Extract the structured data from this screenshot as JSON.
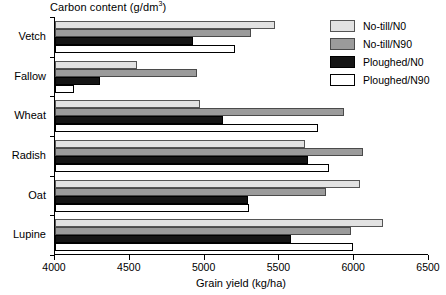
{
  "chart_data": {
    "type": "bar",
    "orientation": "horizontal",
    "title": "Carbon content (g/dm3)",
    "title_main": "Carbon content (g/dm",
    "title_sup": "3",
    "title_tail": ")",
    "xlabel": "Grain yield (kg/ha)",
    "ylabel": "",
    "xlim": [
      4000,
      6500
    ],
    "xticks": [
      4000,
      4500,
      5000,
      5500,
      6000,
      6500
    ],
    "xtick_labels": [
      "4000",
      "4500",
      "5000",
      "5500",
      "6000",
      "6500"
    ],
    "grid": false,
    "legend_position": "top-right",
    "categories": [
      "Vetch",
      "Fallow",
      "Wheat",
      "Radish",
      "Oat",
      "Lupine"
    ],
    "series": [
      {
        "name": "No-till/N0",
        "color": "#e2e2e2",
        "values": [
          5470,
          4550,
          4970,
          5670,
          6040,
          6195
        ]
      },
      {
        "name": "No-till/N90",
        "color": "#9b9b9b",
        "values": [
          5310,
          4950,
          5930,
          6060,
          5810,
          5980
        ]
      },
      {
        "name": "Ploughed/N0",
        "color": "#151515",
        "values": [
          4920,
          4300,
          5120,
          5690,
          5290,
          5580
        ]
      },
      {
        "name": "Ploughed/N90",
        "color": "#ffffff",
        "values": [
          5200,
          4130,
          5760,
          5830,
          5300,
          5990
        ]
      }
    ]
  }
}
